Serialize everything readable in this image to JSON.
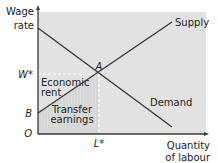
{
  "diagram": {
    "y_axis_label_line1": "Wage",
    "y_axis_label_line2": "rate",
    "x_axis_label_line1": "Quantity",
    "x_axis_label_line2": "of labour",
    "origin_label": "O",
    "w_star_label": "W*",
    "l_star_label": "L*",
    "b_label": "B",
    "a_label": "A",
    "supply_label": "Supply",
    "demand_label": "Demand",
    "economic_rent_line1": "Economic",
    "economic_rent_line2": "rent",
    "transfer_earnings_line1": "Transfer",
    "transfer_earnings_line2": "earnings",
    "colors": {
      "panel": "#e2e2e2",
      "line": "#3a3a3a",
      "hatch": "#c9c9c9",
      "dashed": "#ffffff"
    }
  }
}
